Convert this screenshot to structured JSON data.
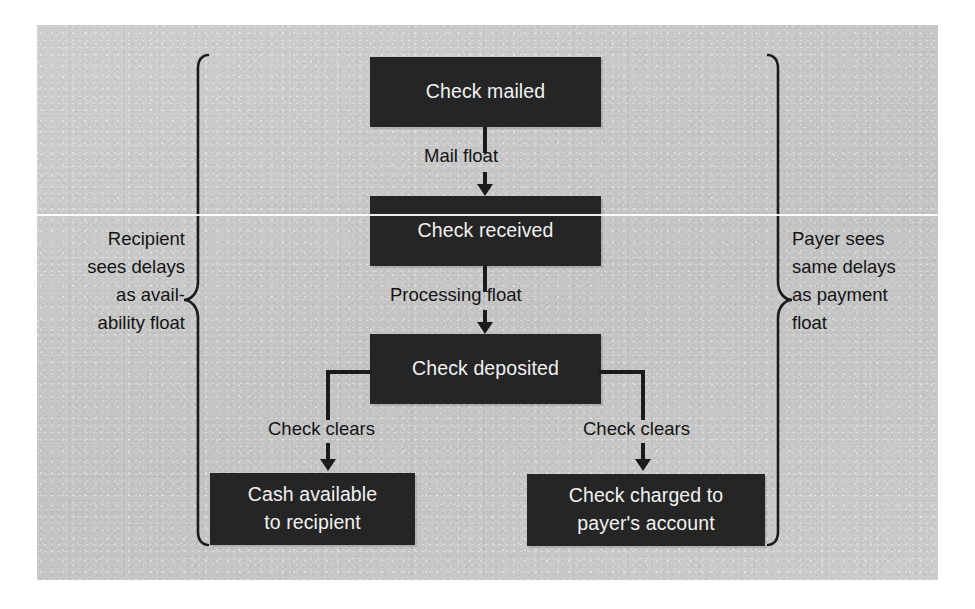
{
  "diagram": {
    "box_fill": "#252525",
    "box_text_color": "#f2f2f2",
    "panel_color": "#c9c9c9",
    "line_color": "#1b1b1b"
  },
  "nodes": {
    "mailed": "Check mailed",
    "received": "Check received",
    "deposited": "Check deposited",
    "cash_line1": "Cash available",
    "cash_line2": "to recipient",
    "charged_line1": "Check charged to",
    "charged_line2": "payer's account"
  },
  "edges": {
    "mail_float": "Mail float",
    "processing_float": "Processing float",
    "check_clears_left": "Check clears",
    "check_clears_right": "Check clears"
  },
  "annotations": {
    "left": {
      "line1": "Recipient",
      "line2": "sees delays",
      "line3": "as avail-",
      "line4": "ability float"
    },
    "right": {
      "line1": "Payer sees",
      "line2": "same delays",
      "line3": "as payment",
      "line4": "float"
    }
  }
}
